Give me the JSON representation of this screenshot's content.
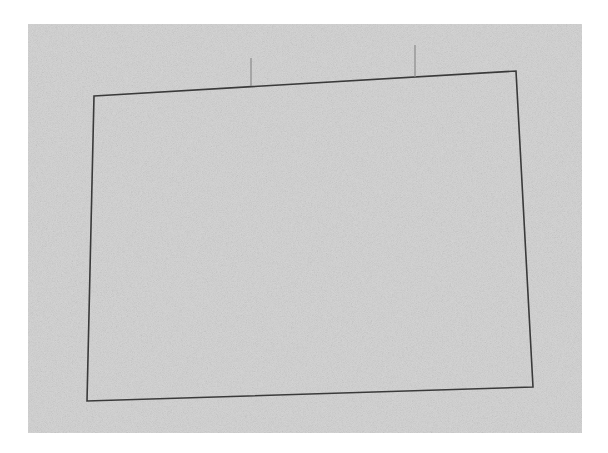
{
  "canvas": {
    "width": 608,
    "height": 453,
    "page_bg": "#ffffff"
  },
  "background_panel": {
    "x": 28,
    "y": 24,
    "width": 554,
    "height": 409,
    "fill": "#d6d6d6"
  },
  "quadrilateral": {
    "stroke": "#3a3a3a",
    "stroke_width": 1.6,
    "points": [
      [
        94,
        96
      ],
      [
        516,
        71
      ],
      [
        533,
        387
      ],
      [
        87,
        401
      ]
    ]
  },
  "ticks": [
    {
      "x1": 251,
      "y1": 58,
      "x2": 251,
      "y2": 86,
      "stroke": "#8a8a8a"
    },
    {
      "x1": 415,
      "y1": 45,
      "x2": 415,
      "y2": 77,
      "stroke": "#8a8a8a"
    }
  ]
}
